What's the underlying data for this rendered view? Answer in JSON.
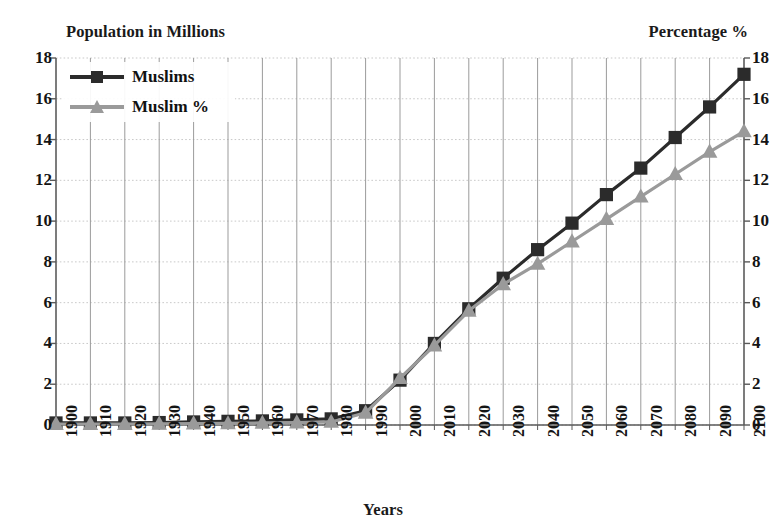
{
  "chart_data": {
    "type": "line",
    "title": "",
    "xlabel": "Years",
    "ylabel": "Population in Millions",
    "ylabel_right": "Percentage %",
    "xlim": [
      1900,
      2100
    ],
    "ylim": [
      0,
      18
    ],
    "ylim_right": [
      0,
      18
    ],
    "ytick_step": 2,
    "grid": true,
    "legend_position": "upper-left-inside",
    "x": [
      1900,
      1910,
      1920,
      1930,
      1940,
      1950,
      1960,
      1970,
      1980,
      1990,
      2000,
      2010,
      2020,
      2030,
      2040,
      2050,
      2060,
      2070,
      2080,
      2090,
      2100
    ],
    "categories": [
      "1900",
      "1910",
      "1920",
      "1930",
      "1940",
      "1950",
      "1960",
      "1970",
      "1980",
      "1990",
      "2000",
      "2010",
      "2020",
      "2030",
      "2040",
      "2050",
      "2060",
      "2070",
      "2080",
      "2090",
      "2100"
    ],
    "yticks": [
      "0",
      "2",
      "4",
      "6",
      "8",
      "10",
      "12",
      "14",
      "16",
      "18"
    ],
    "yticks_right": [
      "0",
      "2",
      "4",
      "6",
      "8",
      "10",
      "12",
      "14",
      "16",
      "18"
    ],
    "series": [
      {
        "name": "Muslims",
        "color": "#2b2b2b",
        "marker": "square",
        "axis": "left",
        "values": [
          0.1,
          0.1,
          0.1,
          0.12,
          0.15,
          0.18,
          0.2,
          0.25,
          0.3,
          0.7,
          2.2,
          4.0,
          5.7,
          7.2,
          8.6,
          9.9,
          11.3,
          12.6,
          14.1,
          15.6,
          17.2
        ]
      },
      {
        "name": "Muslim %",
        "color": "#9a9a9a",
        "marker": "triangle",
        "axis": "right",
        "values": [
          0.05,
          0.05,
          0.05,
          0.06,
          0.07,
          0.08,
          0.1,
          0.12,
          0.15,
          0.6,
          2.3,
          3.9,
          5.6,
          6.9,
          7.9,
          9.0,
          10.1,
          11.2,
          12.3,
          13.4,
          14.4
        ]
      }
    ]
  },
  "legend": {
    "items": [
      {
        "label": "Muslims"
      },
      {
        "label": "Muslim %"
      }
    ]
  },
  "colors": {
    "series_dark": "#2b2b2b",
    "series_gray": "#9a9a9a",
    "grid": "#9b9b9b",
    "grid_minor": "#c9c9c9",
    "axis": "#5a5a5a",
    "text": "#141414",
    "background": "#ffffff"
  },
  "geometry": {
    "plot_left": 56,
    "plot_right": 744,
    "plot_top": 58,
    "plot_bottom": 425
  }
}
